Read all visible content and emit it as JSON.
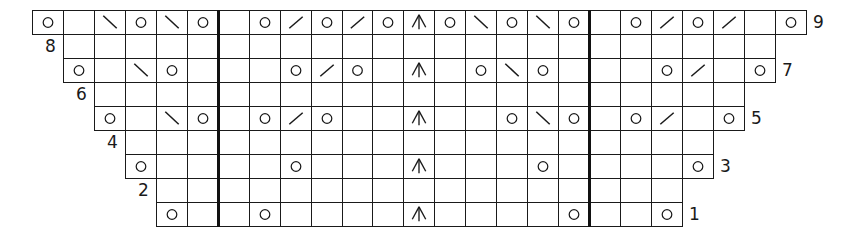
{
  "chart_title": "",
  "grid": {
    "x0": 32,
    "y0": 10,
    "cell_width": 30.95,
    "cell_height": 24,
    "total_columns": 25,
    "line_color": "#1a1a1a",
    "thick_dividers_after_columns": [
      5,
      17
    ]
  },
  "legend_symbols": {
    "O": "yarn-over",
    "\\": "ssk-left-leaning-decrease",
    "/": "k2tog-right-leaning-decrease",
    "^": "centered-double-decrease",
    "_": "knit-empty"
  },
  "rows": [
    {
      "number": "9",
      "label_side": "right",
      "start_col": 0,
      "cells": [
        "O",
        "_",
        "\\",
        "O",
        "\\",
        "O",
        "_",
        "O",
        "/",
        "O",
        "/",
        "O",
        "^",
        "O",
        "\\",
        "O",
        "\\",
        "O",
        "_",
        "O",
        "/",
        "O",
        "/",
        "_",
        "O"
      ]
    },
    {
      "number": "8",
      "label_side": "left",
      "start_col": 1,
      "cells": [
        "_",
        "_",
        "_",
        "_",
        "_",
        "_",
        "_",
        "_",
        "_",
        "_",
        "_",
        "_",
        "_",
        "_",
        "_",
        "_",
        "_",
        "_",
        "_",
        "_",
        "_",
        "_",
        "_"
      ]
    },
    {
      "number": "7",
      "label_side": "right",
      "start_col": 1,
      "cells": [
        "O",
        "_",
        "\\",
        "O",
        "_",
        "_",
        "_",
        "O",
        "/",
        "O",
        "_",
        "^",
        "_",
        "O",
        "\\",
        "O",
        "_",
        "_",
        "_",
        "O",
        "/",
        "_",
        "O"
      ]
    },
    {
      "number": "6",
      "label_side": "left",
      "start_col": 2,
      "cells": [
        "_",
        "_",
        "_",
        "_",
        "_",
        "_",
        "_",
        "_",
        "_",
        "_",
        "_",
        "_",
        "_",
        "_",
        "_",
        "_",
        "_",
        "_",
        "_",
        "_",
        "_"
      ]
    },
    {
      "number": "5",
      "label_side": "right",
      "start_col": 2,
      "cells": [
        "O",
        "_",
        "\\",
        "O",
        "_",
        "O",
        "/",
        "O",
        "_",
        "_",
        "^",
        "_",
        "_",
        "O",
        "\\",
        "O",
        "_",
        "O",
        "/",
        "_",
        "O"
      ]
    },
    {
      "number": "4",
      "label_side": "left",
      "start_col": 3,
      "cells": [
        "_",
        "_",
        "_",
        "_",
        "_",
        "_",
        "_",
        "_",
        "_",
        "_",
        "_",
        "_",
        "_",
        "_",
        "_",
        "_",
        "_",
        "_",
        "_"
      ]
    },
    {
      "number": "3",
      "label_side": "right",
      "start_col": 3,
      "cells": [
        "O",
        "_",
        "_",
        "_",
        "_",
        "O",
        "_",
        "_",
        "_",
        "^",
        "_",
        "_",
        "_",
        "O",
        "_",
        "_",
        "_",
        "_",
        "O"
      ]
    },
    {
      "number": "2",
      "label_side": "left",
      "start_col": 4,
      "cells": [
        "_",
        "_",
        "_",
        "_",
        "_",
        "_",
        "_",
        "_",
        "_",
        "_",
        "_",
        "_",
        "_",
        "_",
        "_",
        "_",
        "_"
      ]
    },
    {
      "number": "1",
      "label_side": "right",
      "start_col": 4,
      "cells": [
        "O",
        "_",
        "_",
        "O",
        "_",
        "_",
        "_",
        "_",
        "^",
        "_",
        "_",
        "_",
        "_",
        "O",
        "_",
        "_",
        "O"
      ]
    }
  ]
}
